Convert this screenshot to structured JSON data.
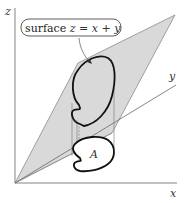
{
  "diagram": {
    "axes": {
      "x_label": "x",
      "y_label": "y",
      "z_label": "z"
    },
    "callout": {
      "text_prefix": "surface ",
      "text_math": "z = x + y"
    },
    "region_label": "A",
    "colors": {
      "plane_fill": "#d9d9d9",
      "plane_stroke": "#8a8a8a",
      "axis": "#666666",
      "curve": "#111111"
    }
  }
}
